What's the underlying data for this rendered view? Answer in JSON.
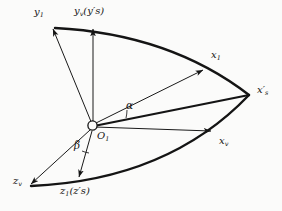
{
  "figure": {
    "type": "coordinate-axes-rotation-diagram",
    "background_color": "#fbfbfa",
    "stroke_color": "#141414",
    "origin": {
      "label_main": "O",
      "label_sub": "1",
      "x": 92,
      "y": 125
    },
    "axes": [
      {
        "name": "y1",
        "label_main": "y",
        "label_sub": "1",
        "label_suffix": "",
        "tip": [
          52,
          27
        ],
        "label_pos": [
          36,
          8
        ]
      },
      {
        "name": "yv-ys-prime",
        "label_main": "y",
        "label_sub": "v",
        "label_suffix": "(y′s)",
        "tip": [
          94,
          27
        ],
        "label_pos": [
          76,
          7
        ]
      },
      {
        "name": "x1",
        "label_main": "x",
        "label_sub": "1",
        "label_suffix": "",
        "tip": [
          205,
          68
        ],
        "label_pos": [
          212,
          52
        ]
      },
      {
        "name": "xs-prime",
        "label_main": "x′",
        "label_sub": "s",
        "label_suffix": "",
        "tip": [
          249,
          95
        ],
        "label_pos": [
          258,
          87
        ]
      },
      {
        "name": "xv",
        "label_main": "x",
        "label_sub": "v",
        "label_suffix": "",
        "tip": [
          213,
          131
        ],
        "label_pos": [
          220,
          138
        ]
      },
      {
        "name": "zv",
        "label_main": "z",
        "label_sub": "v",
        "label_suffix": "",
        "tip": [
          29,
          185
        ],
        "label_pos": [
          14,
          178
        ]
      },
      {
        "name": "z1-zs-prime",
        "label_main": "z",
        "label_sub": "1",
        "label_suffix": "(z′s)",
        "tip": [
          77,
          180
        ],
        "label_pos": [
          62,
          187
        ]
      }
    ],
    "angles": [
      {
        "name": "alpha",
        "symbol": "α",
        "label_pos": [
          128,
          104
        ],
        "between": [
          "x1",
          "xs-prime"
        ]
      },
      {
        "name": "beta",
        "symbol": "β",
        "label_pos": [
          76,
          143
        ],
        "between": [
          "zv",
          "z1-zs-prime"
        ]
      }
    ],
    "arcs": [
      {
        "name": "upper-arc",
        "from": [
          55,
          28
        ],
        "to": [
          249,
          95
        ],
        "bulge": "outward-top"
      },
      {
        "name": "lower-arc",
        "from": [
          31,
          186
        ],
        "to": [
          249,
          95
        ],
        "bulge": "outward-bottom"
      }
    ]
  }
}
